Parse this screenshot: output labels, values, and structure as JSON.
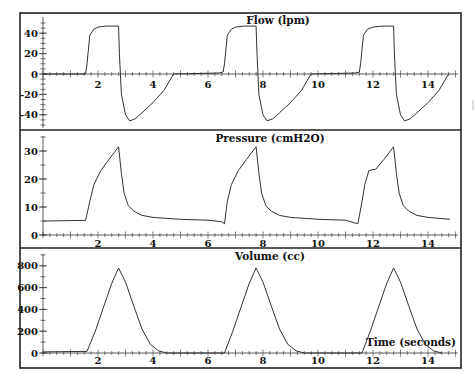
{
  "chart_data": [
    {
      "type": "line",
      "title": "Flow (lpm)",
      "xlabel": "",
      "ylabel": "",
      "ylim": [
        -50,
        50
      ],
      "xlim": [
        0,
        15
      ],
      "y_ticks": [
        -40,
        -20,
        0,
        20,
        40
      ],
      "x_ticks": [
        2,
        4,
        6,
        8,
        10,
        12,
        14
      ],
      "series": [
        {
          "name": "Flow",
          "x": [
            0,
            1.55,
            1.6,
            1.7,
            1.85,
            2.0,
            2.3,
            2.75,
            2.78,
            2.85,
            3.0,
            3.15,
            3.35,
            3.6,
            4.0,
            4.4,
            4.75,
            6.4,
            6.55,
            6.6,
            6.7,
            6.85,
            7.0,
            7.3,
            7.75,
            7.78,
            7.85,
            8.0,
            8.15,
            8.35,
            8.6,
            9.0,
            9.4,
            9.75,
            11.35,
            11.5,
            11.55,
            11.65,
            11.8,
            12.0,
            12.3,
            12.75,
            12.78,
            12.85,
            13.0,
            13.15,
            13.35,
            13.6,
            14.0,
            14.4,
            14.75
          ],
          "values": [
            0,
            0,
            10,
            38,
            44,
            46,
            47,
            47,
            20,
            -20,
            -40,
            -46,
            -44,
            -38,
            -28,
            -16,
            0,
            1,
            2,
            10,
            38,
            44,
            46,
            47,
            47,
            20,
            -20,
            -40,
            -46,
            -44,
            -38,
            -28,
            -16,
            0,
            1,
            2,
            10,
            38,
            44,
            46,
            47,
            47,
            20,
            -20,
            -40,
            -46,
            -44,
            -38,
            -28,
            -16,
            0
          ]
        }
      ]
    },
    {
      "type": "line",
      "title": "Pressure (cmH2O)",
      "xlabel": "",
      "ylabel": "",
      "ylim": [
        0,
        35
      ],
      "xlim": [
        0,
        15
      ],
      "y_ticks": [
        0,
        10,
        20,
        30
      ],
      "x_ticks": [
        2,
        4,
        6,
        8,
        10,
        12,
        14
      ],
      "series": [
        {
          "name": "Pressure",
          "x": [
            0,
            1.55,
            1.7,
            1.85,
            2.1,
            2.4,
            2.75,
            2.85,
            2.95,
            3.1,
            3.3,
            3.6,
            4.0,
            5.0,
            6.0,
            6.5,
            6.6,
            6.7,
            6.85,
            7.1,
            7.4,
            7.75,
            7.85,
            7.95,
            8.1,
            8.3,
            8.6,
            9.0,
            10.0,
            11.0,
            11.45,
            11.6,
            11.7,
            11.85,
            12.1,
            12.4,
            12.75,
            12.85,
            12.95,
            13.1,
            13.3,
            13.6,
            14.0,
            14.8
          ],
          "values": [
            5,
            5.2,
            12,
            18,
            23,
            27,
            31.5,
            22,
            15,
            10.5,
            8.5,
            7,
            6.3,
            5.6,
            5.3,
            4.7,
            4,
            12,
            18,
            23,
            27,
            31.5,
            22,
            15,
            10.5,
            8.5,
            7,
            6.3,
            5.6,
            5.3,
            4,
            12,
            18,
            23,
            23.5,
            27,
            31.5,
            22,
            15,
            10.5,
            8.5,
            7,
            6.3,
            5.6
          ]
        }
      ]
    },
    {
      "type": "line",
      "title": "Volume (cc)",
      "xlabel": "Time (seconds)",
      "ylabel": "",
      "ylim": [
        0,
        900
      ],
      "xlim": [
        0,
        15
      ],
      "y_ticks": [
        0,
        200,
        400,
        600,
        800
      ],
      "x_ticks": [
        2,
        4,
        6,
        8,
        10,
        12,
        14
      ],
      "series": [
        {
          "name": "Volume",
          "x": [
            0,
            1.6,
            1.9,
            2.2,
            2.5,
            2.75,
            3.0,
            3.3,
            3.6,
            3.9,
            4.2,
            4.5,
            6.6,
            6.9,
            7.2,
            7.5,
            7.75,
            8.0,
            8.3,
            8.6,
            8.9,
            9.2,
            9.5,
            11.6,
            11.9,
            12.2,
            12.5,
            12.75,
            13.0,
            13.3,
            13.6,
            13.9,
            14.2,
            14.5
          ],
          "values": [
            10,
            15,
            200,
            420,
            640,
            780,
            650,
            430,
            220,
            80,
            20,
            0,
            0,
            200,
            420,
            640,
            780,
            650,
            430,
            220,
            80,
            20,
            0,
            0,
            200,
            420,
            640,
            780,
            650,
            430,
            220,
            80,
            20,
            0
          ]
        }
      ]
    }
  ],
  "panels": {
    "flow": {
      "title": "Flow (lpm)",
      "y_labels": [
        "40",
        "20",
        "0",
        "-20",
        "-40"
      ]
    },
    "pressure": {
      "title": "Pressure (cmH2O)",
      "y_labels": [
        "30",
        "20",
        "10",
        "0"
      ]
    },
    "volume": {
      "title": "Volume (cc)",
      "y_labels": [
        "800",
        "600",
        "400",
        "200",
        "0"
      ],
      "x_axis_label": "Time (seconds)"
    }
  },
  "x_tick_labels": [
    "2",
    "4",
    "6",
    "8",
    "10",
    "12",
    "14"
  ],
  "colors": {
    "line": "#333333",
    "frame": "#222222",
    "background": "#ffffff"
  }
}
